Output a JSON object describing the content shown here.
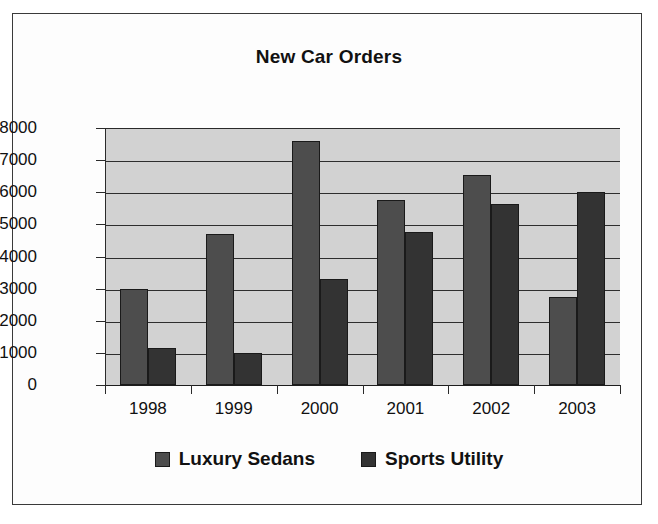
{
  "chart_data": {
    "type": "bar",
    "title": "New Car Orders",
    "xlabel": "",
    "ylabel": "",
    "categories": [
      "1998",
      "1999",
      "2000",
      "2001",
      "2002",
      "2003"
    ],
    "series": [
      {
        "name": "Luxury Sedans",
        "color": "#4d4d4d",
        "values": [
          3000,
          4700,
          7600,
          5750,
          6550,
          2750
        ]
      },
      {
        "name": "Sports Utility",
        "color": "#333333",
        "values": [
          1150,
          1000,
          3300,
          4750,
          5650,
          6000
        ]
      }
    ],
    "ylim": [
      0,
      8000
    ],
    "yticks": [
      0,
      1000,
      2000,
      3000,
      4000,
      5000,
      6000,
      7000,
      8000
    ],
    "ytick_labels": [
      "0",
      "1000",
      "2000",
      "3000",
      "4000",
      "5000",
      "6000",
      "7000",
      "8000"
    ],
    "grid": true,
    "legend_position": "bottom",
    "plot_background": "#d2d2d2",
    "frame_color": "#3a3a3a"
  }
}
